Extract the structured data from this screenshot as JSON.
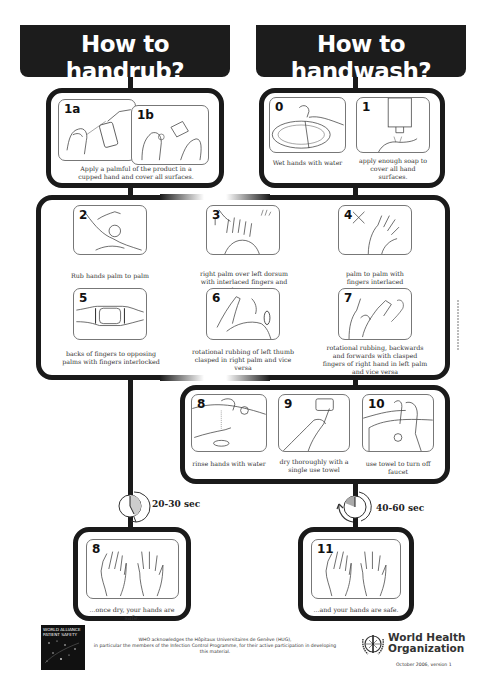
{
  "headers": {
    "handrub": {
      "title": "How to handrub?",
      "subtitle": "WITH ALCOHOL-BASED FORMULATION"
    },
    "handwash": {
      "title": "How to handwash?",
      "subtitle": "WITH SOAP AND WATER"
    }
  },
  "handrub_start": {
    "steps": [
      {
        "num": "1a"
      },
      {
        "num": "1b"
      }
    ],
    "caption": "Apply a palmful of the product in a cupped hand and cover all surfaces."
  },
  "handwash_start": {
    "steps": [
      {
        "num": "0",
        "caption": "Wet hands with water"
      },
      {
        "num": "1",
        "caption": "apply enough soap to cover all hand surfaces."
      }
    ]
  },
  "common_steps": [
    {
      "num": "2",
      "caption": "Rub hands palm to palm"
    },
    {
      "num": "3",
      "caption": "right palm over left dorsum with interlaced fingers and vice versa"
    },
    {
      "num": "4",
      "caption": "palm to palm with fingers interlaced"
    },
    {
      "num": "5",
      "caption": "backs of fingers to opposing palms with fingers interlocked"
    },
    {
      "num": "6",
      "caption": "rotational rubbing of left thumb clasped in right palm and vice versa"
    },
    {
      "num": "7",
      "caption": "rotational rubbing, backwards and forwards with clasped fingers of right hand in left palm and vice versa"
    }
  ],
  "handwash_finish": [
    {
      "num": "8",
      "caption": "rinse hands with water"
    },
    {
      "num": "9",
      "caption": "dry thoroughly with a single use towel"
    },
    {
      "num": "10",
      "caption": "use towel to turn off faucet"
    }
  ],
  "timers": {
    "handrub": "20-30 sec",
    "handwash": "40-60 sec"
  },
  "final": {
    "handrub": {
      "num": "8",
      "caption": "...once dry, your hands are safe."
    },
    "handwash": {
      "num": "11",
      "caption": "...and your hands are safe."
    }
  },
  "footer": {
    "alliance_logo": [
      "WORLD ALLIANCE",
      "PATIENT SAFETY"
    ],
    "acknowledgement_line1": "WHO acknowledges the Hôpitaux Universitaires de Genève (HUG),",
    "acknowledgement_line2": "in particular the members of the Infection Control Programme, for their active participation in developing this material.",
    "who_name_line1": "World Health",
    "who_name_line2": "Organization",
    "version": "October 2006, version 1"
  },
  "colors": {
    "dark": "#1a1a1a",
    "background": "#ffffff",
    "text": "#333333"
  }
}
